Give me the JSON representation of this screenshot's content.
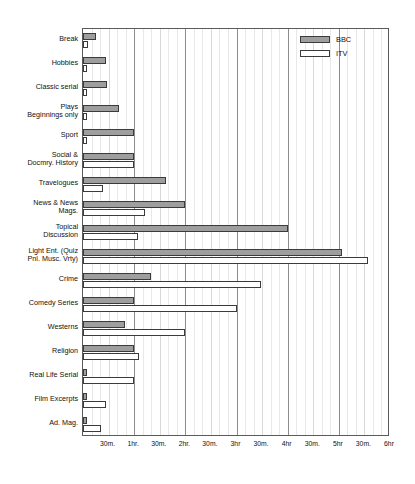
{
  "chart_data": {
    "type": "bar",
    "orientation": "horizontal",
    "title": "",
    "xlabel": "",
    "ylabel": "",
    "xlim_minutes": [
      0,
      360
    ],
    "grid": true,
    "legend_position": "top-right",
    "x_tick_labels": [
      "30m.",
      "1hr.",
      "30m.",
      "2hr.",
      "30m.",
      "3hr",
      "30m.",
      "4hr",
      "30m.",
      "5hr",
      "30m.",
      "6hr"
    ],
    "x_tick_minutes": [
      30,
      60,
      90,
      120,
      150,
      180,
      210,
      240,
      270,
      300,
      330,
      360
    ],
    "categories": [
      "Break",
      "Hobbies",
      "Classic serial",
      "Plays\nBeginnings only",
      "Sport",
      "Social &\nDocmry. History",
      "Travelogues",
      "News & News\nMags.",
      "Topical\nDiscussion",
      "Light Ent. (Quiz\nPnl. Musc. Vrty)",
      "Crime",
      "Comedy Series",
      "Westerns",
      "Religion",
      "Real Life Serial",
      "Film Excerpts",
      "Ad. Mag."
    ],
    "series": [
      {
        "name": "BBC",
        "color": "#9e9e9e",
        "values_minutes": [
          15,
          27,
          28,
          42,
          60,
          60,
          97,
          120,
          240,
          304,
          80,
          60,
          49,
          60,
          5,
          5,
          5
        ]
      },
      {
        "name": "ITV",
        "color": "#ffffff",
        "values_minutes": [
          6,
          5,
          5,
          5,
          5,
          60,
          24,
          73,
          65,
          334,
          209,
          181,
          120,
          66,
          60,
          27,
          21
        ]
      }
    ]
  },
  "legend": {
    "entries": [
      {
        "label": "BBC",
        "style": "bbc"
      },
      {
        "label": "ITV",
        "style": "itv"
      }
    ]
  }
}
